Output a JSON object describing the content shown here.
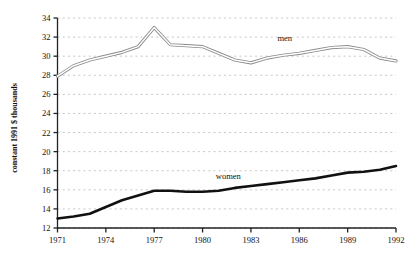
{
  "chart_data": {
    "type": "line",
    "title": "",
    "subtitle": "",
    "xlabel": "",
    "ylabel": "constant 1991 $ thousands",
    "xlim": [
      1971,
      1992
    ],
    "ylim": [
      12,
      34
    ],
    "ytick_step": 2,
    "xtick_step": 3,
    "grid": true,
    "grid_style": "dashed-horizontal",
    "legend_position": "inline-annotation",
    "x": [
      1971,
      1972,
      1973,
      1974,
      1975,
      1976,
      1977,
      1978,
      1979,
      1980,
      1981,
      1982,
      1983,
      1984,
      1985,
      1986,
      1987,
      1988,
      1989,
      1990,
      1991,
      1992
    ],
    "xticks": [
      "1971",
      "1974",
      "1977",
      "1980",
      "1983",
      "1986",
      "1989",
      "1992"
    ],
    "yticks": [
      "12",
      "14",
      "16",
      "18",
      "20",
      "22",
      "24",
      "26",
      "28",
      "30",
      "32",
      "34"
    ],
    "series": [
      {
        "name": "men",
        "label": "men",
        "style": "double-outline",
        "color": "#8a8a8a",
        "values": [
          27.9,
          29.0,
          29.6,
          30.0,
          30.4,
          31.0,
          33.0,
          31.2,
          31.1,
          31.0,
          30.3,
          29.6,
          29.3,
          29.8,
          30.1,
          30.3,
          30.6,
          30.9,
          31.0,
          30.7,
          29.8,
          29.5
        ]
      },
      {
        "name": "women",
        "label": "women",
        "style": "solid-thick",
        "color": "#111111",
        "values": [
          13.0,
          13.2,
          13.5,
          14.2,
          14.9,
          15.4,
          15.9,
          15.9,
          15.8,
          15.8,
          15.9,
          16.2,
          16.4,
          16.6,
          16.8,
          17.0,
          17.2,
          17.5,
          17.8,
          17.9,
          18.1,
          18.5
        ]
      }
    ],
    "annotations": [
      {
        "text": "men",
        "x": 1985.1,
        "y": 31.6
      },
      {
        "text": "women",
        "x": 1981.6,
        "y": 17.1
      }
    ]
  },
  "colors": {
    "background": "#ffffff",
    "axis": "#222222",
    "grid": "#b9b9b9",
    "men_line": "#8a8a8a",
    "women_line": "#111111",
    "text": "#111111"
  }
}
